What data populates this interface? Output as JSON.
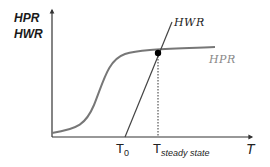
{
  "diagram": {
    "y_axis_label_line1": "HPR",
    "y_axis_label_line2": "HWR",
    "x_axis_label": "T",
    "curve_hwr_label": "HWR",
    "curve_hpr_label": "HPR",
    "t0_label": "T",
    "t0_subscript": "0",
    "tss_label": "T",
    "tss_subscript": "steady state",
    "colors": {
      "axis": "#333333",
      "hpr_curve": "#777777",
      "hwr_line": "#444444",
      "hpr_label": "#888888",
      "hwr_label": "#222222",
      "intersection_dot": "#000000"
    }
  }
}
